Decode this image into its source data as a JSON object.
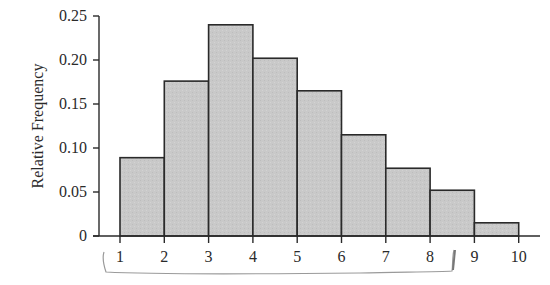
{
  "chart_data": {
    "type": "bar",
    "subtype": "histogram",
    "title": "",
    "xlabel": "",
    "ylabel": "Relative Frequency",
    "bin_edges": [
      1,
      2,
      3,
      4,
      5,
      6,
      7,
      8,
      9,
      10
    ],
    "categories": [
      "1-2",
      "2-3",
      "3-4",
      "4-5",
      "5-6",
      "6-7",
      "7-8",
      "8-9",
      "9-10"
    ],
    "values": [
      0.089,
      0.176,
      0.24,
      0.202,
      0.165,
      0.115,
      0.077,
      0.052,
      0.015
    ],
    "ylim": [
      0,
      0.25
    ],
    "xlim": [
      1,
      10
    ],
    "y_ticks": [
      "0",
      "0.05",
      "0.10",
      "0.15",
      "0.20",
      "0.25"
    ],
    "x_ticks": [
      "1",
      "2",
      "3",
      "4",
      "5",
      "6",
      "7",
      "8",
      "9",
      "10"
    ],
    "grid": false,
    "legend": null,
    "annotations": [
      "hand-drawn bracket under x-axis spanning from 1 to about 8.5"
    ],
    "bar_fill_color": "#c8c8c8",
    "bar_edge_color": "#2a2a2a"
  }
}
